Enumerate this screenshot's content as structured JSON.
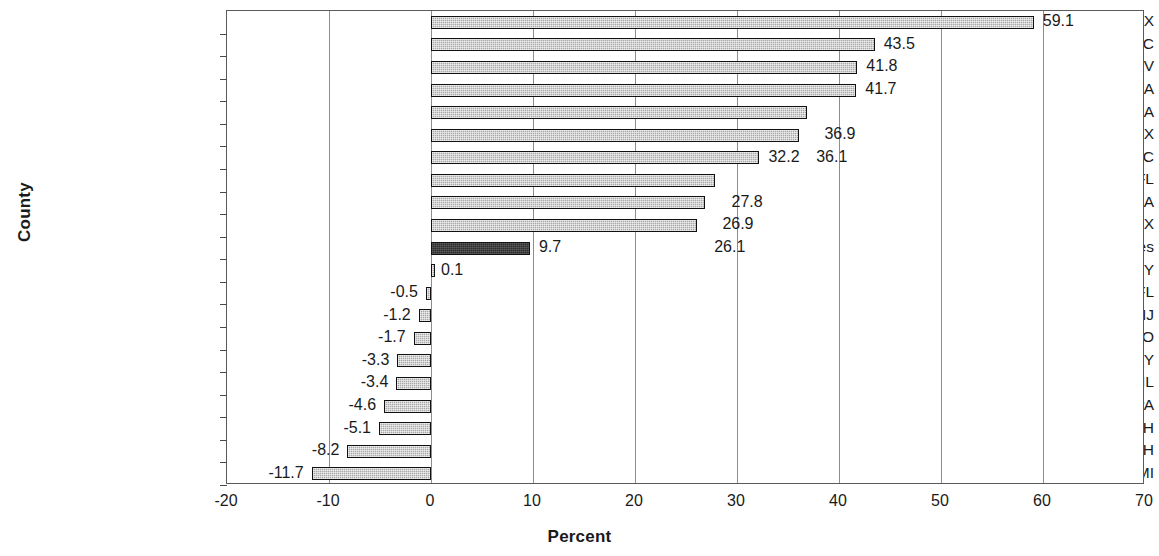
{
  "chart_data": {
    "type": "bar",
    "orientation": "horizontal",
    "title": "",
    "xlabel": "Percent",
    "ylabel": "County",
    "xlim": [
      -20,
      70
    ],
    "xticks": [
      -20,
      -10,
      0,
      10,
      20,
      30,
      40,
      50,
      60,
      70
    ],
    "xtick_labels": [
      "-20",
      "-10",
      "0",
      "10",
      "20",
      "30",
      "40",
      "50",
      "60",
      "70"
    ],
    "grid": "vertical",
    "legend": "none",
    "categories": [
      "Collin, TX",
      "Wake, NC",
      "Clark, NV",
      "Riverside, CA",
      "Gwinnett, GA",
      "Hidalgo, TX",
      "Mecklenburg, NC",
      "Orange, FL",
      "Kern, CA",
      "Travis, TX",
      "United States",
      "Queens, NY",
      "Pinellas, FL",
      "Essex, NJ",
      "St. Louis, MO",
      "Erie, NY",
      "Cook, IL",
      "Allegheny, PA",
      "Hamilton, OH",
      "Cuyahoga, OH",
      "Wayne, MI"
    ],
    "values": [
      59.1,
      43.5,
      41.8,
      41.7,
      36.9,
      36.1,
      32.2,
      27.8,
      26.9,
      26.1,
      9.7,
      0.1,
      -0.5,
      -1.2,
      -1.7,
      -3.3,
      -3.4,
      -4.6,
      -5.1,
      -8.2,
      -11.7
    ],
    "value_labels": [
      "59.1",
      "43.5",
      "41.8",
      "41.7",
      "36.9",
      "36.1",
      "32.2",
      "27.8",
      "26.9",
      "26.1",
      "9.7",
      "0.1",
      "-0.5",
      "-1.2",
      "-1.7",
      "-3.3",
      "-3.4",
      "-4.6",
      "-5.1",
      "-8.2",
      "-11.7"
    ],
    "highlight_category": "United States",
    "colors": {
      "bar_fill": "#a8a8a8",
      "bar_border": "#111111",
      "highlight_fill": "#2b2b2b",
      "gridline": "#8d8d8d",
      "frame": "#5a5a5a",
      "text": "#1a1a1a"
    }
  }
}
